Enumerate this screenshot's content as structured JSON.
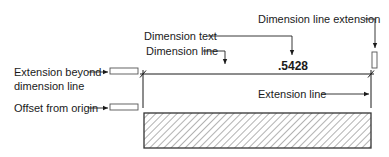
{
  "diagram": {
    "labels": {
      "dimension_line_extension": "Dimension line extension",
      "dimension_text": "Dimension text",
      "dimension_line": "Dimension line",
      "extension_beyond_line1": "Extension beyond",
      "extension_beyond_line2": "dimension line",
      "offset_from_origin": "Offset from origin",
      "extension_line": "Extension line"
    },
    "dimension_value": ".5428",
    "colors": {
      "ink": "#1a1a1a",
      "background": "#ffffff",
      "hatch": "#555555"
    },
    "object": {
      "shape": "rectangle",
      "fill": "diagonal-hatch"
    }
  }
}
